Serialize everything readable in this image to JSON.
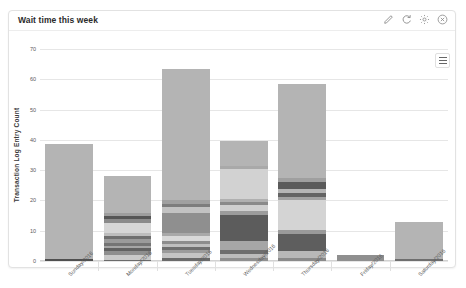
{
  "card": {
    "title": "Wait time this week",
    "header_icons": [
      {
        "name": "edit-icon",
        "label": "Edit"
      },
      {
        "name": "refresh-icon",
        "label": "Refresh"
      },
      {
        "name": "gear-icon",
        "label": "Settings"
      },
      {
        "name": "close-icon",
        "label": "Close"
      }
    ],
    "menu_label": "Chart context menu"
  },
  "chart_data": {
    "type": "bar",
    "title": "Wait time this week",
    "xlabel": "",
    "ylabel": "Transaction Log Entry Count",
    "ylim": [
      0,
      70
    ],
    "yticks": [
      0,
      10,
      20,
      30,
      40,
      50,
      60,
      70
    ],
    "grid": true,
    "legend": "none",
    "stacked": true,
    "categories": [
      "Sunday/2016",
      "Monday/2016",
      "Tuesday/2016",
      "Wednesday/2016",
      "Thursday/2016",
      "Friday/2016",
      "Saturday/2016"
    ],
    "totals": [
      38.5,
      29.0,
      63.5,
      39.5,
      58.5,
      2.0,
      13.0
    ],
    "stacks": [
      {
        "category": "Sunday/2016",
        "total": 38.5,
        "segments": [
          {
            "value": 0.8,
            "color": "#4f4f4f"
          },
          {
            "value": 37.7,
            "color": "#b4b4b4"
          }
        ]
      },
      {
        "category": "Monday/2016",
        "total": 29.0,
        "segments": [
          {
            "value": 0.5,
            "color": "#6a6a6a"
          },
          {
            "value": 1.6,
            "color": "#c9c9c9"
          },
          {
            "value": 1.1,
            "color": "#8e8e8e"
          },
          {
            "value": 1.0,
            "color": "#616161"
          },
          {
            "value": 0.9,
            "color": "#a5a5a5"
          },
          {
            "value": 1.0,
            "color": "#747474"
          },
          {
            "value": 1.2,
            "color": "#9a9a9a"
          },
          {
            "value": 1.1,
            "color": "#6f6f6f"
          },
          {
            "value": 0.9,
            "color": "#bdbdbd"
          },
          {
            "value": 3.4,
            "color": "#d6d6d6"
          },
          {
            "value": 1.1,
            "color": "#8a8a8a"
          },
          {
            "value": 1.2,
            "color": "#565656"
          },
          {
            "value": 1.0,
            "color": "#9e9e9e"
          },
          {
            "value": 12.0,
            "color": "#b4b4b4"
          }
        ]
      },
      {
        "category": "Tuesday/2016",
        "total": 63.5,
        "segments": [
          {
            "value": 1.1,
            "color": "#6a6a6a"
          },
          {
            "value": 1.6,
            "color": "#c4c4c4"
          },
          {
            "value": 1.0,
            "color": "#9b9b9b"
          },
          {
            "value": 0.9,
            "color": "#6f6f6f"
          },
          {
            "value": 1.0,
            "color": "#bfbfbf"
          },
          {
            "value": 1.0,
            "color": "#8d8d8d"
          },
          {
            "value": 1.9,
            "color": "#d8d8d8"
          },
          {
            "value": 1.0,
            "color": "#a8a8a8"
          },
          {
            "value": 6.5,
            "color": "#8f8f8f"
          },
          {
            "value": 2.0,
            "color": "#c2c2c2"
          },
          {
            "value": 1.2,
            "color": "#7d7d7d"
          },
          {
            "value": 1.3,
            "color": "#a0a0a0"
          },
          {
            "value": 44.0,
            "color": "#b4b4b4"
          }
        ]
      },
      {
        "category": "Wednesday/2016",
        "total": 39.5,
        "segments": [
          {
            "value": 1.0,
            "color": "#8f8f8f"
          },
          {
            "value": 1.4,
            "color": "#bcbcbc"
          },
          {
            "value": 1.2,
            "color": "#6e6e6e"
          },
          {
            "value": 3.0,
            "color": "#a6a6a6"
          },
          {
            "value": 8.5,
            "color": "#5c5c5c"
          },
          {
            "value": 1.3,
            "color": "#9c9c9c"
          },
          {
            "value": 2.2,
            "color": "#cfcfcf"
          },
          {
            "value": 1.0,
            "color": "#8a8a8a"
          },
          {
            "value": 0.9,
            "color": "#b0b0b0"
          },
          {
            "value": 10.0,
            "color": "#d2d2d2"
          },
          {
            "value": 1.0,
            "color": "#a9a9a9"
          },
          {
            "value": 8.0,
            "color": "#b4b4b4"
          }
        ]
      },
      {
        "category": "Thursday/2016",
        "total": 58.5,
        "segments": [
          {
            "value": 1.0,
            "color": "#8a8a8a"
          },
          {
            "value": 2.2,
            "color": "#b8b8b8"
          },
          {
            "value": 5.8,
            "color": "#5e5e5e"
          },
          {
            "value": 1.2,
            "color": "#9a9a9a"
          },
          {
            "value": 10.0,
            "color": "#d4d4d4"
          },
          {
            "value": 1.0,
            "color": "#a2a2a2"
          },
          {
            "value": 1.4,
            "color": "#636363"
          },
          {
            "value": 1.2,
            "color": "#b5b5b5"
          },
          {
            "value": 2.4,
            "color": "#5a5a5a"
          },
          {
            "value": 1.3,
            "color": "#9f9f9f"
          },
          {
            "value": 31.0,
            "color": "#b4b4b4"
          }
        ]
      },
      {
        "category": "Friday/2016",
        "total": 2.0,
        "segments": [
          {
            "value": 2.0,
            "color": "#8f8f8f"
          }
        ]
      },
      {
        "category": "Saturday/2016",
        "total": 13.0,
        "segments": [
          {
            "value": 0.6,
            "color": "#6e6e6e"
          },
          {
            "value": 12.4,
            "color": "#b4b4b4"
          }
        ]
      }
    ]
  }
}
